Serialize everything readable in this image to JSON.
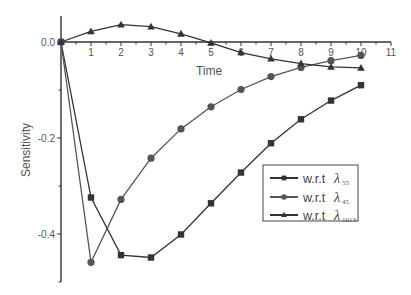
{
  "chart_data": {
    "type": "line",
    "title": "",
    "xlabel": "Time",
    "ylabel": "Sensitivity",
    "xlim": [
      0,
      11
    ],
    "ylim": [
      -0.5,
      0.055
    ],
    "x_ticks": [
      1,
      2,
      3,
      4,
      5,
      6,
      7,
      8,
      9,
      10,
      11
    ],
    "y_ticks": [
      "0.0",
      "-0.2",
      "-0.4"
    ],
    "y_tick_values": [
      0.0,
      -0.2,
      -0.4
    ],
    "grid": false,
    "legend_position": "lower right (inside)",
    "x": [
      0,
      1,
      2,
      3,
      4,
      5,
      6,
      7,
      8,
      9,
      10
    ],
    "series": [
      {
        "name": "w.r.t λ55",
        "prefix": "w.r.t",
        "symbol": "λ",
        "subscript": "55",
        "marker": "square",
        "color": "#333333",
        "values": [
          0.0,
          -0.324,
          -0.444,
          -0.449,
          -0.401,
          -0.336,
          -0.272,
          -0.211,
          -0.161,
          -0.122,
          -0.09
        ]
      },
      {
        "name": "w.r.t λ45",
        "prefix": "w.r.t",
        "symbol": "λ",
        "subscript": "45",
        "marker": "circle",
        "color": "#555555",
        "values": [
          0.0,
          -0.459,
          -0.328,
          -0.242,
          -0.181,
          -0.135,
          -0.099,
          -0.072,
          -0.053,
          -0.039,
          -0.028
        ]
      },
      {
        "name": "w.r.t λ1013",
        "prefix": "w.r.t",
        "symbol": "λ",
        "subscript": "1013",
        "marker": "triangle",
        "color": "#333333",
        "values": [
          0.0,
          0.022,
          0.036,
          0.032,
          0.017,
          -0.002,
          -0.022,
          -0.035,
          -0.045,
          -0.052,
          -0.054
        ]
      }
    ]
  }
}
